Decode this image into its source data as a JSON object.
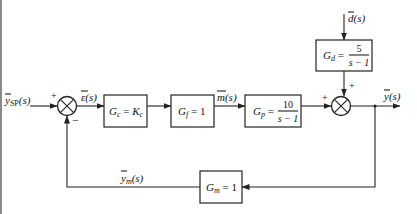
{
  "diagram": {
    "type": "feedback control block diagram",
    "signals": {
      "setpoint": {
        "symbol": "y",
        "sub": "SP",
        "arg": "(s)"
      },
      "error": {
        "symbol": "ε",
        "arg": "(s)"
      },
      "manipulated": {
        "symbol": "m",
        "arg": "(s)"
      },
      "disturbance": {
        "symbol": "d",
        "arg": "(s)"
      },
      "output": {
        "symbol": "y",
        "arg": "(s)"
      },
      "measured": {
        "symbol": "y",
        "sub": "m",
        "arg": "(s)"
      }
    },
    "blocks": {
      "controller": {
        "name": "G",
        "sub": "c",
        "eq": " = ",
        "rhs": "K",
        "rhs_sub": "c"
      },
      "final_element": {
        "name": "G",
        "sub": "f",
        "eq": " = 1"
      },
      "process": {
        "name": "G",
        "sub": "p",
        "eq": " =",
        "num": "10",
        "den": "s − 1"
      },
      "disturbance": {
        "name": "G",
        "sub": "d",
        "eq": " =",
        "num": "5",
        "den": "s − 1"
      },
      "measurement": {
        "name": "G",
        "sub": "m",
        "eq": " = 1"
      }
    },
    "junction_signs": {
      "sp_plus": "+",
      "fb_minus": "−",
      "process_plus": "+",
      "disturbance_plus": "+"
    }
  }
}
